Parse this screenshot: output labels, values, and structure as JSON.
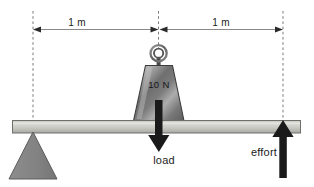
{
  "diagram": {
    "dimensions": [
      {
        "label": "1 m",
        "name": "left-span"
      },
      {
        "label": "1 m",
        "name": "right-span"
      }
    ],
    "weight": {
      "label": "10 N",
      "shape": "trapezoid-weight",
      "handle": "ring-handle"
    },
    "forces": [
      {
        "label": "load",
        "direction": "down"
      },
      {
        "label": "effort",
        "direction": "up"
      }
    ],
    "parts": {
      "beam": "beam",
      "fulcrum": "fulcrum-triangle"
    },
    "colors": {
      "beam_light": "#d3d3cf",
      "beam_mid": "#b9b9b4",
      "beam_edge": "#6e6e6a",
      "fulcrum": "#8b8b8b",
      "fulcrum_edge": "#5c5c5c",
      "weight_light": "#cfcfcf",
      "weight_dark": "#6a6a6a",
      "arrow": "#1a1a1a",
      "dashed": "#7a7a7a",
      "dim_line": "#8a8a8a",
      "text": "#1c1c1c"
    }
  }
}
